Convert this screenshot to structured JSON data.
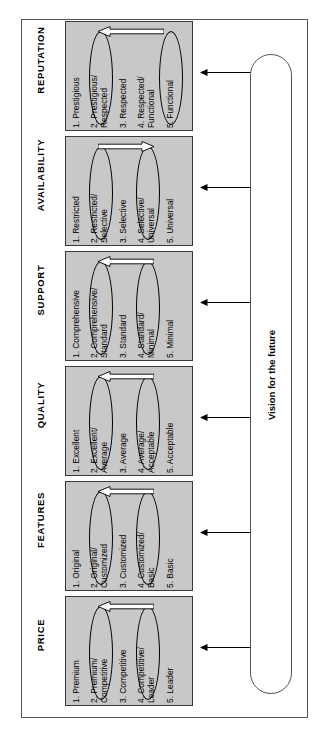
{
  "diagram": {
    "vision_label": "Vision for the future",
    "colors": {
      "panel_fill": "#c8c8c8",
      "panel_border": "#3a3a3a",
      "frame_border": "#555555",
      "text": "#000000",
      "arrow": "#000000"
    },
    "bands": [
      {
        "key": "reputation",
        "title": "REPUTATION",
        "items": [
          "1. Prestigious",
          "2. Prestigious/\nRespected",
          "3. Respected",
          "4. Respected/\nFunctional",
          "5. Functional"
        ],
        "highlighted_items": [
          2,
          5
        ],
        "arrow_direction": "left",
        "arrow_from_item": 5,
        "arrow_to_item": 2
      },
      {
        "key": "availability",
        "title": "AVAILABILITY",
        "items": [
          "1. Restricted",
          "2. Restricted/\nSelective",
          "3. Selective",
          "4. Selective/\nUniversal",
          "5. Universal"
        ],
        "highlighted_items": [
          2,
          4
        ],
        "arrow_direction": "right",
        "arrow_from_item": 2,
        "arrow_to_item": 4
      },
      {
        "key": "support",
        "title": "SUPPORT",
        "items": [
          "1. Comprehensive",
          "2. Comprehensive/\nStandard",
          "3. Standard",
          "4. Standard/\nMinimal",
          "5. Minimal"
        ],
        "highlighted_items": [
          2,
          4
        ],
        "arrow_direction": "left",
        "arrow_from_item": 4,
        "arrow_to_item": 2
      },
      {
        "key": "quality",
        "title": "QUALITY",
        "items": [
          "1. Excellent",
          "2. Excellent/\nAverage",
          "3. Average",
          "4. Average/\nAcceptable",
          "5. Acceptable"
        ],
        "highlighted_items": [
          2,
          4
        ],
        "arrow_direction": "left",
        "arrow_from_item": 4,
        "arrow_to_item": 2
      },
      {
        "key": "features",
        "title": "FEATURES",
        "items": [
          "1. Original",
          "2. Original/\nCustomized",
          "3. Customized",
          "4. Customized/\nBasic",
          "5. Basic"
        ],
        "highlighted_items": [
          2,
          4
        ],
        "arrow_direction": "left",
        "arrow_from_item": 4,
        "arrow_to_item": 2
      },
      {
        "key": "price",
        "title": "PRICE",
        "items": [
          "1. Premium",
          "2. Premium/\nCompetitive",
          "3. Competitive",
          "4. Competitive/\nLeader",
          "5. Leader"
        ],
        "highlighted_items": [
          2,
          4
        ],
        "arrow_direction": "left",
        "arrow_from_item": 4,
        "arrow_to_item": 2
      }
    ]
  }
}
